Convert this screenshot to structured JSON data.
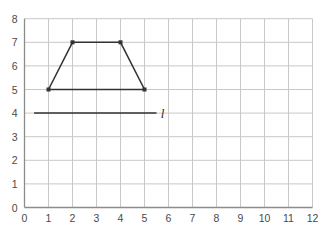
{
  "chart_data": {
    "type": "scatter",
    "title": "",
    "xlabel": "",
    "ylabel": "",
    "xlim": [
      0,
      12
    ],
    "ylim": [
      0,
      8
    ],
    "xticks": [
      "0",
      "1",
      "2",
      "3",
      "4",
      "5",
      "6",
      "7",
      "8",
      "9",
      "10",
      "11",
      "12"
    ],
    "yticks": [
      "0",
      "1",
      "2",
      "3",
      "4",
      "5",
      "6",
      "7",
      "8"
    ],
    "grid": true,
    "legend": "none",
    "grid_color": "#c8c8c8",
    "axis_color": "#8c8c8c",
    "shape_color": "#333333",
    "tick_text_color": "#4a4a4a",
    "series": [
      {
        "name": "trapezoid",
        "kind": "closed-polygon",
        "closed": true,
        "markers": true,
        "points": [
          {
            "x": 1,
            "y": 5
          },
          {
            "x": 2,
            "y": 7
          },
          {
            "x": 4,
            "y": 7
          },
          {
            "x": 5,
            "y": 5
          }
        ]
      },
      {
        "name": "line-l",
        "kind": "segment",
        "closed": false,
        "markers": false,
        "label": "l",
        "label_x": 5.75,
        "label_y": 4,
        "points": [
          {
            "x": 0.4,
            "y": 4
          },
          {
            "x": 5.5,
            "y": 4
          }
        ]
      }
    ]
  }
}
